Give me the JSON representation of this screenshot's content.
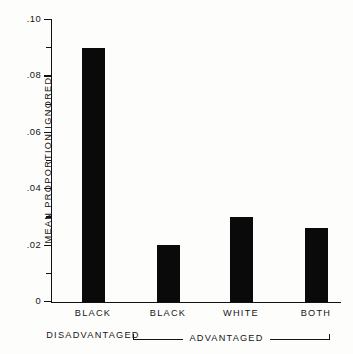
{
  "chart_data": {
    "type": "bar",
    "title": "",
    "xlabel": "",
    "ylabel": "MEAN  PROPORTION  IGNORED",
    "categories": [
      "BLACK",
      "BLACK",
      "WHITE",
      "BOTH"
    ],
    "values": [
      0.09,
      0.02,
      0.03,
      0.026
    ],
    "ylim": [
      0,
      0.1
    ],
    "grid": false,
    "legend": null,
    "y_major_ticks": [
      0.1,
      0.08,
      0.06,
      0.04,
      0.02,
      0
    ],
    "y_major_tick_labels": [
      ".10",
      ".08",
      ".06",
      ".04",
      ".02",
      "0"
    ],
    "y_minor_ticks": [
      0.09,
      0.07,
      0.05,
      0.03,
      0.01
    ],
    "group_labels": {
      "first": "DISADVANTAGED",
      "bracket": "ADVANTAGED"
    },
    "bar_color": "#0a0a0a",
    "axis_color": "#111111",
    "background": "#fdfdfc"
  },
  "axis": {
    "y_label": "MEAN  PROPORTION  IGNORED",
    "ticks": [
      {
        "label": ".10",
        "value": 0.1,
        "major": true
      },
      {
        "label": "",
        "value": 0.09,
        "major": false
      },
      {
        "label": ".08",
        "value": 0.08,
        "major": true
      },
      {
        "label": "",
        "value": 0.07,
        "major": false
      },
      {
        "label": ".06",
        "value": 0.06,
        "major": true
      },
      {
        "label": "",
        "value": 0.05,
        "major": false
      },
      {
        "label": ".04",
        "value": 0.04,
        "major": true
      },
      {
        "label": "",
        "value": 0.03,
        "major": false
      },
      {
        "label": ".02",
        "value": 0.02,
        "major": true
      },
      {
        "label": "",
        "value": 0.01,
        "major": false
      },
      {
        "label": "0",
        "value": 0.0,
        "major": true
      }
    ]
  },
  "bars": [
    {
      "label": "BLACK",
      "sublabel": "DISADVANTAGED",
      "value": 0.09
    },
    {
      "label": "BLACK",
      "sublabel": "",
      "value": 0.02
    },
    {
      "label": "WHITE",
      "sublabel": "",
      "value": 0.03
    },
    {
      "label": "BOTH",
      "sublabel": "",
      "value": 0.026
    }
  ],
  "bracket": {
    "label": "ADVANTAGED"
  }
}
